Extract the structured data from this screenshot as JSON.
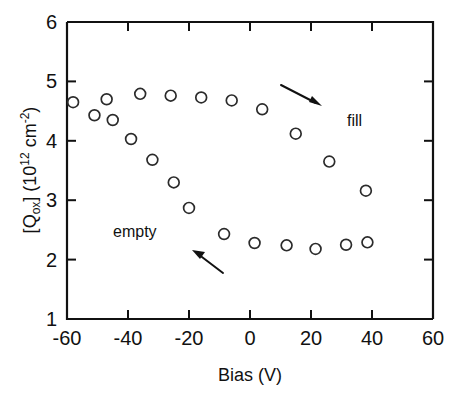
{
  "chart_data": {
    "type": "scatter",
    "title": "",
    "xlabel": "Bias (V)",
    "ylabel_parts": {
      "open_bracket": "[Q",
      "subscript": "ox",
      "close_bracket": "] (10",
      "exponent": "12",
      "units_base": " cm",
      "units_exponent": "-2",
      "tail": ")"
    },
    "ylabel_plain": "[Qox] (10^12 cm^-2)",
    "xlim": [
      -60,
      60
    ],
    "ylim": [
      1,
      6
    ],
    "xticks": [
      -60,
      -40,
      -20,
      0,
      20,
      40,
      60
    ],
    "xticklabels": [
      "-60",
      "-40",
      "-20",
      "0",
      "20",
      "40",
      "60"
    ],
    "yticks": [
      1,
      2,
      3,
      4,
      5,
      6
    ],
    "yticklabels": [
      "1",
      "2",
      "3",
      "4",
      "5",
      "6"
    ],
    "grid": false,
    "legend": "none",
    "marker": "open-circle",
    "annotations": [
      {
        "text": "fill",
        "x": 29,
        "y": 4.25
      },
      {
        "text": "empty",
        "x": -33,
        "y": 2.85
      }
    ],
    "arrows": [
      {
        "name": "fill-arrow",
        "x_start": -11,
        "y_start": 4.94,
        "x_end": 1.5,
        "y_end": 4.6,
        "direction": "down-right"
      },
      {
        "name": "empty-arrow",
        "x_start": -9,
        "y_start": 1.76,
        "x_end": -18,
        "y_end": 2.12,
        "direction": "up-left"
      }
    ],
    "series": [
      {
        "name": "fill",
        "label": "fill",
        "comment": "upper branch, sweeping from negative bias toward positive bias",
        "points": [
          {
            "x": -58.0,
            "y": 4.65
          },
          {
            "x": -51.0,
            "y": 4.43
          },
          {
            "x": -47.0,
            "y": 4.7
          },
          {
            "x": -45.0,
            "y": 4.35
          },
          {
            "x": -39.0,
            "y": 4.03
          },
          {
            "x": -36.0,
            "y": 4.79
          },
          {
            "x": -32.0,
            "y": 3.68
          },
          {
            "x": -26.0,
            "y": 4.76
          },
          {
            "x": -25.0,
            "y": 3.3
          },
          {
            "x": -20.0,
            "y": 2.87
          },
          {
            "x": -16.0,
            "y": 4.73
          },
          {
            "x": -6.0,
            "y": 4.68
          },
          {
            "x": 4.0,
            "y": 4.53
          },
          {
            "x": 15.0,
            "y": 4.12
          },
          {
            "x": 26.0,
            "y": 3.65
          },
          {
            "x": 38.0,
            "y": 3.16
          }
        ]
      },
      {
        "name": "empty",
        "label": "empty",
        "comment": "lower branch, sweeping from positive bias back toward negative bias",
        "points": [
          {
            "x": -8.5,
            "y": 2.43
          },
          {
            "x": 1.5,
            "y": 2.28
          },
          {
            "x": 12.0,
            "y": 2.24
          },
          {
            "x": 21.5,
            "y": 2.18
          },
          {
            "x": 31.5,
            "y": 2.25
          },
          {
            "x": 38.5,
            "y": 2.29
          }
        ]
      }
    ]
  },
  "figure": {
    "background": "#ffffff",
    "axis_color": "#111111",
    "marker_color": "#2b2b2b"
  }
}
